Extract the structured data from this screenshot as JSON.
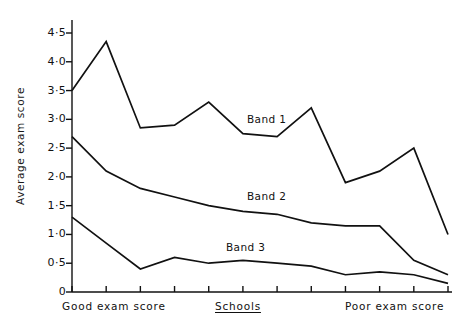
{
  "chart_data": {
    "type": "line",
    "title": "",
    "subtitle": "",
    "xlabel": "Schools",
    "ylabel": "Average exam score",
    "ylim": [
      0,
      4.75
    ],
    "grid": false,
    "legend_position": "inline-labels",
    "y_ticks": [
      "0",
      "0·5",
      "1·0",
      "1·5",
      "2·0",
      "2·5",
      "3·0",
      "3·5",
      "4·0",
      "4·5"
    ],
    "y_tick_values": [
      0,
      0.5,
      1.0,
      1.5,
      2.0,
      2.5,
      3.0,
      3.5,
      4.0,
      4.5
    ],
    "x_tick_count": 12,
    "x": [
      1,
      2,
      3,
      4,
      5,
      6,
      7,
      8,
      9,
      10,
      11,
      12
    ],
    "x_axis_annotations": [
      {
        "text": "Good exam score",
        "position": "left",
        "underline": false
      },
      {
        "text": "Schools",
        "position": "center",
        "underline": true
      },
      {
        "text": "Poor exam score",
        "position": "right",
        "underline": false
      }
    ],
    "series": [
      {
        "name": "Band 1",
        "label": "Band 1",
        "values": [
          3.5,
          4.35,
          2.85,
          2.9,
          3.3,
          2.75,
          2.7,
          3.2,
          1.9,
          2.1,
          2.5,
          1.0
        ]
      },
      {
        "name": "Band 2",
        "label": "Band 2",
        "values": [
          2.7,
          2.1,
          1.8,
          1.65,
          1.5,
          1.4,
          1.35,
          1.2,
          1.15,
          1.15,
          0.55,
          0.3
        ]
      },
      {
        "name": "Band 3",
        "label": "Band 3",
        "values": [
          1.3,
          0.85,
          0.4,
          0.6,
          0.5,
          0.55,
          0.5,
          0.45,
          0.3,
          0.35,
          0.3,
          0.15
        ]
      }
    ],
    "annotations": [
      {
        "text": "Band 1",
        "series": "Band 1",
        "x_px": 245,
        "y_px": 118
      },
      {
        "text": "Band 2",
        "series": "Band 2",
        "x_px": 245,
        "y_px": 196
      },
      {
        "text": "Band 3",
        "series": "Band 3",
        "x_px": 224,
        "y_px": 246
      }
    ],
    "line_color": "#111111",
    "background_color": "#ffffff"
  }
}
